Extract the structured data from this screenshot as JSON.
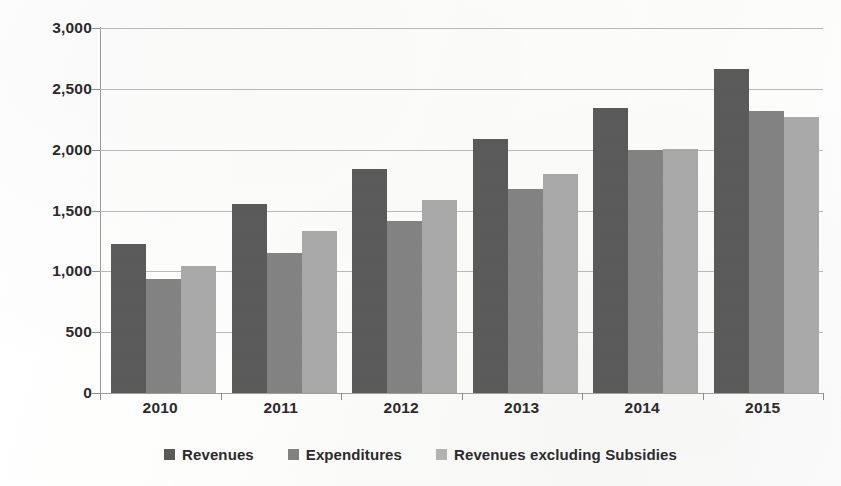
{
  "chart_data": {
    "type": "bar",
    "title": "",
    "subtitle": "",
    "xlabel": "",
    "ylabel": "",
    "categories": [
      "2010",
      "2011",
      "2012",
      "2013",
      "2014",
      "2015"
    ],
    "series": [
      {
        "name": "Revenues",
        "color": "#595959",
        "values": [
          1225,
          1555,
          1840,
          2090,
          2340,
          2665
        ]
      },
      {
        "name": "Expenditures",
        "color": "#828282",
        "values": [
          940,
          1150,
          1410,
          1675,
          2000,
          2320
        ]
      },
      {
        "name": "Revenues excluding Subsidies",
        "color": "#a9a9a9",
        "values": [
          1045,
          1335,
          1590,
          1800,
          2005,
          2265
        ]
      }
    ],
    "ylim": [
      0,
      3000
    ],
    "ytick_values": [
      0,
      500,
      1000,
      1500,
      2000,
      2500,
      3000
    ],
    "ytick_labels": [
      "0",
      "500",
      "1,000",
      "1,500",
      "2,000",
      "2,500",
      "3,000"
    ],
    "grid": true,
    "legend_position": "bottom",
    "annotations": []
  },
  "legend": {
    "items": [
      {
        "label": "Revenues",
        "swatch": "dark-gray"
      },
      {
        "label": "Expenditures",
        "swatch": "medium-gray"
      },
      {
        "label": "Revenues excluding Subsidies",
        "swatch": "light-gray"
      }
    ]
  }
}
